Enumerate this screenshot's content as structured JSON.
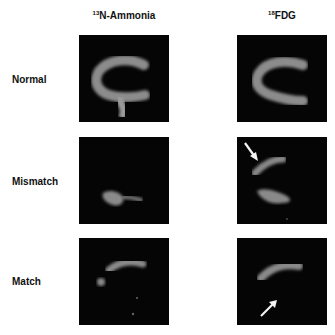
{
  "figure": {
    "columns": [
      {
        "isotope": "13",
        "tracer": "N-Ammonia"
      },
      {
        "isotope": "18",
        "tracer": "FDG"
      }
    ],
    "rows": [
      {
        "label": "Normal"
      },
      {
        "label": "Mismatch"
      },
      {
        "label": "Match"
      }
    ],
    "annotations": [
      {
        "panel": "Mismatch-FDG",
        "type": "arrow",
        "direction": "down-right"
      },
      {
        "panel": "Match-FDG",
        "type": "arrow",
        "direction": "up-right"
      }
    ],
    "colors": {
      "panel_bg": "#050505",
      "uptake": "#8a8a8a",
      "text": "#111111"
    }
  }
}
